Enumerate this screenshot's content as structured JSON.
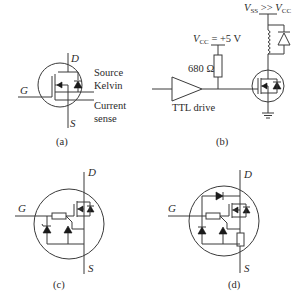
{
  "figure": {
    "panels": [
      {
        "id": "a",
        "caption": "(a)",
        "terminals": {
          "drain": "D",
          "gate": "G",
          "source": "S"
        },
        "annotations": {
          "source_kelvin_1": "Source",
          "source_kelvin_2": "Kelvin",
          "current_sense_1": "Current",
          "current_sense_2": "sense"
        }
      },
      {
        "id": "b",
        "caption": "(b)",
        "supply_low": {
          "v": "V",
          "sub": "CC",
          "rest": " = +5 V"
        },
        "supply_high": {
          "v1": "V",
          "sub1": "SS",
          "mid": " >> ",
          "v2": "V",
          "sub2": "CC"
        },
        "resistor": "680 Ω",
        "driver": "TTL drive"
      },
      {
        "id": "c",
        "caption": "(c)",
        "terminals": {
          "drain": "D",
          "gate": "G",
          "source": "S"
        }
      },
      {
        "id": "d",
        "caption": "(d)",
        "terminals": {
          "drain": "D",
          "gate": "G",
          "source": "S"
        }
      }
    ]
  }
}
